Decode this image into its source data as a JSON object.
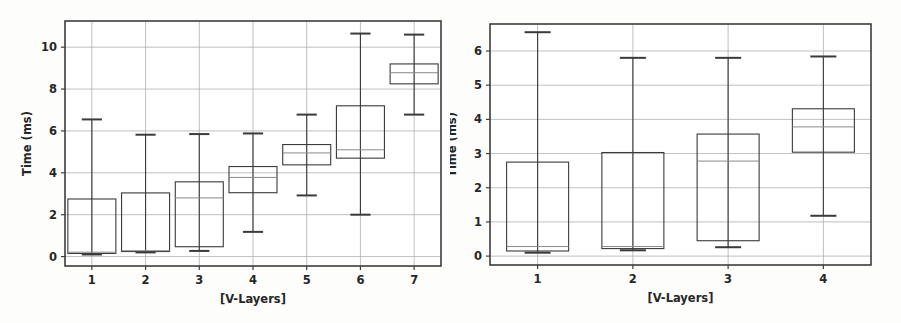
{
  "figure": {
    "background_color": "#fdfdfc",
    "panel_count": 2
  },
  "chart_data": [
    {
      "type": "box",
      "panel": "left",
      "title": "",
      "xlabel": "[V-Layers]",
      "ylabel": "Time (ms)",
      "categories": [
        "1",
        "2",
        "3",
        "4",
        "5",
        "6",
        "7"
      ],
      "xtick_labels": [
        "1",
        "2",
        "3",
        "4",
        "5",
        "6",
        "7"
      ],
      "ytick_labels": [
        "0",
        "2",
        "4",
        "6",
        "8",
        "10"
      ],
      "yticks": [
        0,
        2,
        4,
        6,
        8,
        10
      ],
      "ylim": [
        -0.45,
        11.25
      ],
      "xlim": [
        0.5,
        7.5
      ],
      "grid": true,
      "grid_axis": "both",
      "grid_color": "#b0b0b0",
      "box_edge_color": "#3a3a3a",
      "box_face_color": "#ffffff",
      "median_color": "#8a8a8a",
      "whisker_color": "#3a3a3a",
      "boxes": [
        {
          "label": "1",
          "whisker_low": 0.1,
          "q1": 0.15,
          "median": 0.21,
          "q3": 2.75,
          "whisker_high": 6.55
        },
        {
          "label": "2",
          "whisker_low": 0.2,
          "q1": 0.24,
          "median": 0.28,
          "q3": 3.04,
          "whisker_high": 5.82
        },
        {
          "label": "3",
          "whisker_low": 0.27,
          "q1": 0.47,
          "median": 2.8,
          "q3": 3.57,
          "whisker_high": 5.85
        },
        {
          "label": "4",
          "whisker_low": 1.18,
          "q1": 3.05,
          "median": 3.78,
          "q3": 4.3,
          "whisker_high": 5.88
        },
        {
          "label": "5",
          "whisker_low": 2.92,
          "q1": 4.38,
          "median": 4.95,
          "q3": 5.35,
          "whisker_high": 6.78
        },
        {
          "label": "6",
          "whisker_low": 2.0,
          "q1": 4.7,
          "median": 5.1,
          "q3": 7.2,
          "whisker_high": 10.65
        },
        {
          "label": "7",
          "whisker_low": 6.78,
          "q1": 8.25,
          "median": 8.78,
          "q3": 9.2,
          "whisker_high": 10.6
        }
      ]
    },
    {
      "type": "box",
      "panel": "right",
      "title": "",
      "xlabel": "[V-Layers]",
      "ylabel": "Time (ms)",
      "categories": [
        "1",
        "2",
        "3",
        "4"
      ],
      "xtick_labels": [
        "1",
        "2",
        "3",
        "4"
      ],
      "ytick_labels": [
        "0",
        "1",
        "2",
        "3",
        "4",
        "5",
        "6"
      ],
      "yticks": [
        0,
        1,
        2,
        3,
        4,
        5,
        6
      ],
      "ylim": [
        -0.26,
        6.79
      ],
      "xlim": [
        0.5,
        4.5
      ],
      "grid": true,
      "grid_axis": "both",
      "grid_color": "#b0b0b0",
      "box_edge_color": "#3a3a3a",
      "box_face_color": "#ffffff",
      "median_color": "#8a8a8a",
      "whisker_color": "#3a3a3a",
      "boxes": [
        {
          "label": "1",
          "whisker_low": 0.1,
          "q1": 0.15,
          "median": 0.28,
          "q3": 2.75,
          "whisker_high": 6.55
        },
        {
          "label": "2",
          "whisker_low": 0.17,
          "q1": 0.22,
          "median": 0.28,
          "q3": 3.03,
          "whisker_high": 5.8
        },
        {
          "label": "3",
          "whisker_low": 0.26,
          "q1": 0.45,
          "median": 2.78,
          "q3": 3.57,
          "whisker_high": 5.8
        },
        {
          "label": "4",
          "whisker_low": 1.18,
          "q1": 3.04,
          "median": 3.78,
          "q3": 4.31,
          "whisker_high": 5.84
        }
      ]
    }
  ]
}
